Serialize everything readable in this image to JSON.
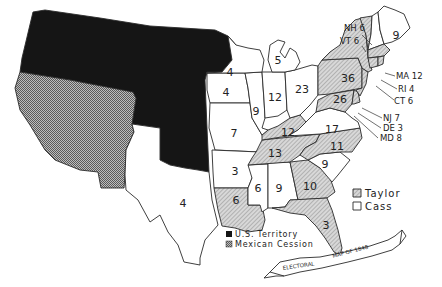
{
  "title": "Electoral Map of 1848",
  "banner": {
    "part1": "ELECTORAL",
    "part2": "MAP OF 1848"
  },
  "legend": {
    "taylor": "Taylor",
    "cass": "Cass",
    "territory": "U.S. Territory",
    "cession": "Mexican Cession"
  },
  "colors": {
    "taylor_hatch": "#9a9a9a",
    "cass": "#ffffff",
    "territory": "#151515",
    "cession_check": "#888888",
    "outline": "#2a2a2a"
  },
  "states": {
    "ME": {
      "votes": "9",
      "winner": "Cass"
    },
    "NH": {
      "label": "NH 6",
      "votes": "6",
      "winner": "Cass"
    },
    "VT": {
      "label": "VT 6",
      "votes": "6",
      "winner": "Taylor"
    },
    "MA": {
      "label": "MA 12",
      "votes": "12",
      "winner": "Taylor"
    },
    "RI": {
      "label": "RI 4",
      "votes": "4",
      "winner": "Taylor"
    },
    "CT": {
      "label": "CT 6",
      "votes": "6",
      "winner": "Taylor"
    },
    "NY": {
      "votes": "36",
      "winner": "Taylor"
    },
    "NJ": {
      "label": "NJ 7",
      "votes": "7",
      "winner": "Taylor"
    },
    "DE": {
      "label": "DE 3",
      "votes": "3",
      "winner": "Taylor"
    },
    "MD": {
      "label": "MD 8",
      "votes": "8",
      "winner": "Taylor"
    },
    "PA": {
      "votes": "26",
      "winner": "Taylor"
    },
    "OH": {
      "votes": "23",
      "winner": "Cass"
    },
    "MI": {
      "votes": "5",
      "winner": "Cass"
    },
    "WI": {
      "votes": "4",
      "winner": "Cass"
    },
    "IA": {
      "votes": "4",
      "winner": "Cass"
    },
    "IL": {
      "votes": "9",
      "winner": "Cass"
    },
    "IN": {
      "votes": "12",
      "winner": "Cass"
    },
    "MO": {
      "votes": "7",
      "winner": "Cass"
    },
    "KY": {
      "votes": "12",
      "winner": "Taylor"
    },
    "VA": {
      "votes": "17",
      "winner": "Cass"
    },
    "TN": {
      "votes": "13",
      "winner": "Taylor"
    },
    "NC": {
      "votes": "11",
      "winner": "Taylor"
    },
    "SC": {
      "votes": "9",
      "winner": "Cass"
    },
    "GA": {
      "votes": "10",
      "winner": "Taylor"
    },
    "FL": {
      "votes": "3",
      "winner": "Taylor"
    },
    "AL": {
      "votes": "9",
      "winner": "Cass"
    },
    "MS": {
      "votes": "6",
      "winner": "Cass"
    },
    "LA": {
      "votes": "6",
      "winner": "Taylor"
    },
    "AR": {
      "votes": "3",
      "winner": "Cass"
    },
    "TX": {
      "votes": "4",
      "winner": "Cass"
    }
  }
}
